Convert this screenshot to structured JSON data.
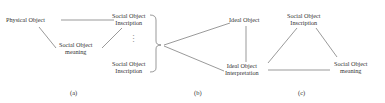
{
  "panel_a": {
    "physical_object": "Physical Object",
    "inscription_top_1": "Social Object",
    "inscription_top_2": "Inscription",
    "meaning_1": "Social Object",
    "meaning_2": "meaning",
    "ellipsis": "⋮",
    "inscription_bottom_1": "Social Object",
    "inscription_bottom_2": "Inscription",
    "caption": "(a)"
  },
  "panel_b": {
    "ideal_object": "Ideal Object",
    "interpretation_1": "Ideal Object",
    "interpretation_2": "Interpretation",
    "caption": "(b)"
  },
  "panel_c": {
    "inscription_1": "Social Object",
    "inscription_2": "Inscription",
    "meaning_1": "Social Object",
    "meaning_2": "meaning",
    "caption": "(c)"
  },
  "colors": {
    "line": "#555555",
    "text": "#333333",
    "background": "#ffffff"
  }
}
